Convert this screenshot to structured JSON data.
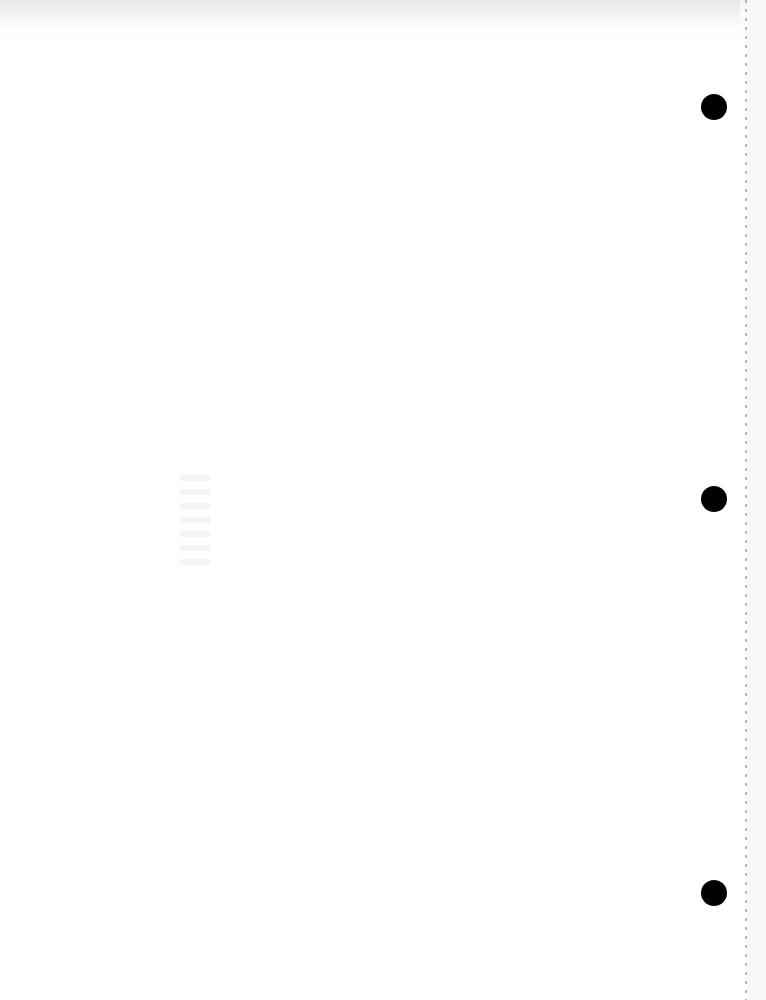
{
  "page": {
    "type": "blank-scanned-page",
    "content_text": "",
    "hole_punches": [
      {
        "x": 714,
        "y": 107
      },
      {
        "x": 714,
        "y": 499
      },
      {
        "x": 714,
        "y": 893
      }
    ],
    "colors": {
      "background": "#ffffff",
      "hole": "#000000",
      "perforation": "#9a9a9a"
    }
  }
}
